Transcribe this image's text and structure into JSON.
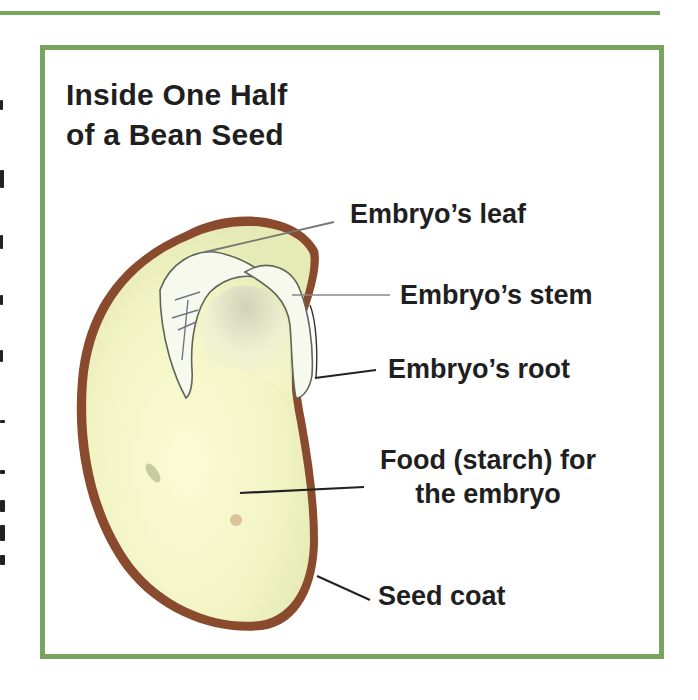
{
  "diagram": {
    "title_line1": "Inside One Half",
    "title_line2": "of a Bean Seed",
    "labels": {
      "leaf": "Embryo’s leaf",
      "stem": "Embryo’s stem",
      "root": "Embryo’s root",
      "food_line1": "Food (starch) for",
      "food_line2": "the embryo",
      "seed_coat": "Seed coat"
    },
    "colors": {
      "frame_green": "#77a45e",
      "seed_coat_brown": "#8a4a2e",
      "cotyledon_fill": "#f4f5c8",
      "embryo_fill": "#f7f9ee",
      "leader_line": "#333333",
      "text": "#1f1f1f"
    }
  }
}
